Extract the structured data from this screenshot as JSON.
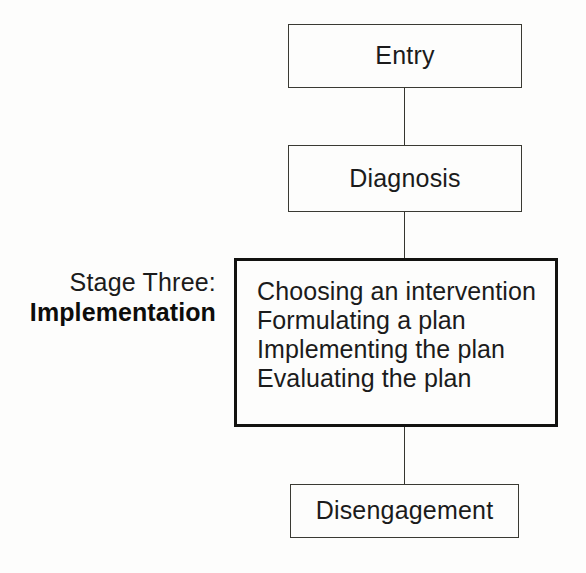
{
  "diagram": {
    "background_color": "#fdfdfc",
    "line_color": "#3a3a33",
    "text_color": "#1b1b1b",
    "nodes": [
      {
        "id": "entry",
        "label": "Entry",
        "emphasis": false
      },
      {
        "id": "diagnosis",
        "label": "Diagnosis",
        "emphasis": false
      },
      {
        "id": "implementation",
        "label": "",
        "emphasis": true
      },
      {
        "id": "disengagement",
        "label": "Disengagement",
        "emphasis": false
      }
    ],
    "stage_box_steps": [
      "Choosing an intervention",
      "Formulating a plan",
      "Implementing the plan",
      "Evaluating the plan"
    ],
    "stage_caption": {
      "line1": "Stage Three:",
      "line2": "Implementation"
    },
    "connectors": [
      {
        "id": "entry-to-diagnosis",
        "from": "entry",
        "to": "diagnosis"
      },
      {
        "id": "diagnosis-to-implementation",
        "from": "diagnosis",
        "to": "implementation"
      },
      {
        "id": "implementation-to-disengagement",
        "from": "implementation",
        "to": "disengagement"
      }
    ]
  }
}
